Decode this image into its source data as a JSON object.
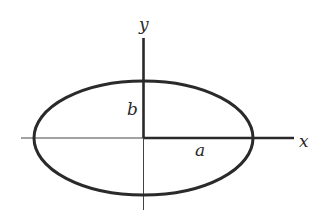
{
  "diagram": {
    "type": "ellipse-with-axes",
    "colors": {
      "stroke": "#2a2a2a",
      "background": "#ffffff"
    },
    "center": {
      "x": 143.5,
      "y": 138
    },
    "ellipse": {
      "rx": 109.5,
      "ry": 57
    },
    "labels": {
      "x_axis": "x",
      "y_axis": "y",
      "semi_major": "a",
      "semi_minor": "b"
    }
  }
}
